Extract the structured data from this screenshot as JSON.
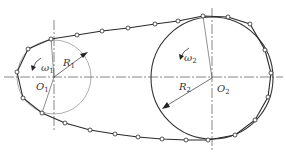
{
  "diagram": {
    "type": "chain-drive",
    "colors": {
      "line": "#2b2b2b",
      "center_line": "#555555",
      "background": "#ffffff",
      "node_fill": "#ffffff"
    },
    "small_sprocket": {
      "center": [
        54,
        77
      ],
      "radius": 37,
      "label_center": "O",
      "label_center_sub": "1",
      "label_radius": "R",
      "label_radius_sub": "1",
      "label_omega": "ω",
      "label_omega_sub": "1"
    },
    "large_sprocket": {
      "center": [
        212,
        78
      ],
      "radius": 60,
      "label_center": "O",
      "label_center_sub": "2",
      "label_radius": "R",
      "label_radius_sub": "2",
      "label_omega": "ω",
      "label_omega_sub": "2"
    },
    "chain_nodes": [
      [
        51,
        39
      ],
      [
        77,
        35
      ],
      [
        102,
        31
      ],
      [
        128,
        28
      ],
      [
        155,
        24
      ],
      [
        178,
        21
      ],
      [
        203,
        16
      ],
      [
        228,
        17
      ],
      [
        250,
        24
      ],
      [
        265,
        50
      ],
      [
        271,
        73
      ],
      [
        268,
        97
      ],
      [
        255,
        120
      ],
      [
        235,
        135
      ],
      [
        208,
        140
      ],
      [
        186,
        140
      ],
      [
        162,
        139
      ],
      [
        138,
        137
      ],
      [
        115,
        134
      ],
      [
        90,
        130
      ],
      [
        65,
        123
      ],
      [
        42,
        113
      ],
      [
        23,
        98
      ],
      [
        17,
        72
      ],
      [
        28,
        49
      ]
    ]
  }
}
